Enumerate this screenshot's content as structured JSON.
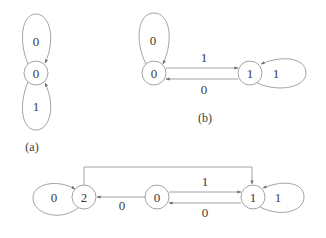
{
  "diagrams": [
    {
      "id": "a",
      "caption": "(a)",
      "nodes": [
        {
          "label": "0"
        }
      ],
      "loops": [
        {
          "node": "0",
          "position": "top",
          "label": "0"
        },
        {
          "node": "0",
          "position": "bottom",
          "label": "1"
        }
      ]
    },
    {
      "id": "b",
      "caption": "(b)",
      "nodes": [
        {
          "label": "0"
        },
        {
          "label": "1"
        }
      ],
      "edges": [
        {
          "from": "0",
          "to": "1",
          "label": "1"
        },
        {
          "from": "1",
          "to": "0",
          "label": "0"
        }
      ],
      "loops": [
        {
          "node": "0",
          "position": "top",
          "label": "0"
        },
        {
          "node": "1",
          "position": "right",
          "label": "1"
        }
      ]
    },
    {
      "id": "c",
      "caption": "",
      "nodes": [
        {
          "label": "2"
        },
        {
          "label": "0"
        },
        {
          "label": "1"
        }
      ],
      "edges": [
        {
          "from": "2",
          "to": "1",
          "label": "",
          "route": "over-top"
        },
        {
          "from": "0",
          "to": "1",
          "label": "1"
        },
        {
          "from": "1",
          "to": "0",
          "label": "0"
        },
        {
          "from": "0",
          "to": "2",
          "label": "0"
        }
      ],
      "loops": [
        {
          "node": "2",
          "position": "left",
          "label": "0"
        },
        {
          "node": "1",
          "position": "right",
          "label": "1"
        }
      ]
    }
  ],
  "colors": {
    "stroke": "#8c8c8c",
    "text": "#3a3a3a",
    "background": "#ffffff"
  }
}
